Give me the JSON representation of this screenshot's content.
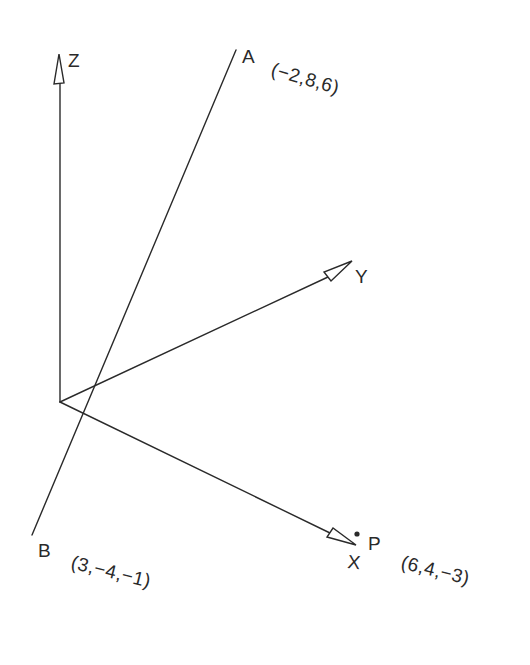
{
  "diagram": {
    "type": "3d-coordinate-axes",
    "axes": [
      {
        "name": "Z",
        "label": "Z"
      },
      {
        "name": "Y",
        "label": "Y"
      },
      {
        "name": "X",
        "label": "X"
      }
    ],
    "line": {
      "endpoint_a": {
        "label": "A",
        "coords": "(−2,8,6)"
      },
      "endpoint_b": {
        "label": "B",
        "coords": "(3,−4,−1)"
      }
    },
    "point": {
      "label": "P",
      "coords": "(6,4,−3)"
    },
    "colors": {
      "ink": "#2a2a2a",
      "background": "#ffffff"
    }
  }
}
